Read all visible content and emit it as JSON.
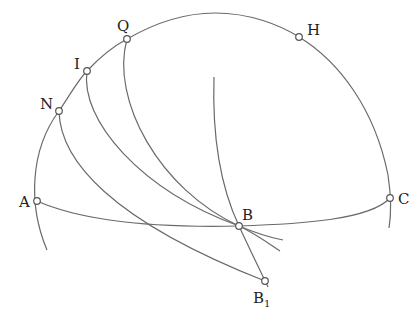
{
  "diagram": {
    "type": "spherical-geometry-construction",
    "points": {
      "Q": {
        "label": "Q",
        "x": 127,
        "y": 39
      },
      "I": {
        "label": "I",
        "x": 87,
        "y": 71
      },
      "N": {
        "label": "N",
        "x": 59,
        "y": 111
      },
      "H": {
        "label": "H",
        "x": 299,
        "y": 37
      },
      "A": {
        "label": "A",
        "x": 37,
        "y": 201
      },
      "B": {
        "label": "B",
        "x": 239,
        "y": 226
      },
      "C": {
        "label": "C",
        "x": 390,
        "y": 198
      },
      "B1": {
        "label": "B",
        "subscript": "1",
        "x": 265,
        "y": 281
      }
    },
    "curves": [
      "outer-great-circle-arc A-N-I-Q-H-C",
      "arc A-B-C",
      "arc Q-B",
      "arc I-B",
      "arc N-B1",
      "arc through B to B1"
    ],
    "colors": {
      "stroke": "#6a6a6a",
      "point_fill": "#ffffff",
      "text": "#222222"
    }
  }
}
